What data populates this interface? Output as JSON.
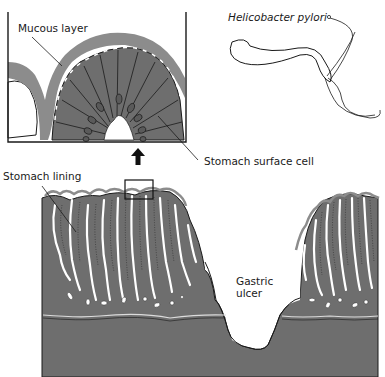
{
  "figure": {
    "labels": {
      "mucous_layer": "Mucous layer",
      "bacterium": "Helicobacter pylori",
      "surface_cell": "Stomach surface cell",
      "stomach_lining": "Stomach lining",
      "gastric_ulcer_line1": "Gastric",
      "gastric_ulcer_line2": "ulcer"
    },
    "colors": {
      "tissue": "#6e6e6e",
      "mucus": "#8c8c8c",
      "outline": "#1a1a1a",
      "background": "#ffffff"
    },
    "icons": {
      "magnify_arrow": "up-arrow"
    }
  }
}
